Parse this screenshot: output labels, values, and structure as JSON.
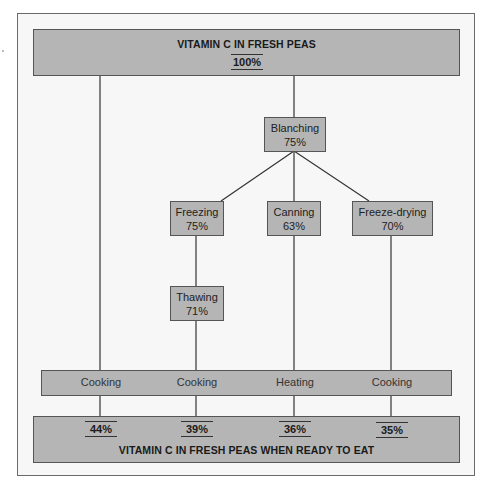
{
  "diagram": {
    "top_box": {
      "title": "VITAMIN C IN FRESH PEAS",
      "value": "100%"
    },
    "nodes": [
      {
        "id": "blanching",
        "label": "Blanching",
        "value": "75%"
      },
      {
        "id": "freezing",
        "label": "Freezing",
        "value": "75%"
      },
      {
        "id": "canning",
        "label": "Canning",
        "value": "63%"
      },
      {
        "id": "freeze-drying",
        "label": "Freeze-drying",
        "value": "70%"
      },
      {
        "id": "thawing",
        "label": "Thawing",
        "value": "71%"
      }
    ],
    "final_steps": [
      "Cooking",
      "Cooking",
      "Heating",
      "Cooking"
    ],
    "results": [
      "44%",
      "39%",
      "36%",
      "35%"
    ],
    "bottom_box": {
      "title": "VITAMIN C IN FRESH PEAS WHEN READY TO EAT"
    },
    "colors": {
      "box_fill": "#b5b5b5",
      "frame_fill": "#f7f7f7",
      "line": "#333333"
    }
  }
}
